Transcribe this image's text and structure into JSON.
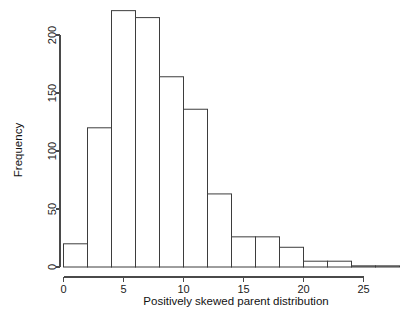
{
  "chart_data": {
    "type": "bar",
    "title": "",
    "subtitle": "",
    "xlabel": "Positively skewed parent distribution",
    "ylabel": "Frequency",
    "bin_width": 2,
    "bin_edges": [
      0,
      2,
      4,
      6,
      8,
      10,
      12,
      14,
      16,
      18,
      20,
      22,
      24,
      26,
      28
    ],
    "categories": [
      "0-2",
      "2-4",
      "4-6",
      "6-8",
      "8-10",
      "10-12",
      "12-14",
      "14-16",
      "16-18",
      "18-20",
      "20-22",
      "22-24",
      "24-26",
      "26-28"
    ],
    "values": [
      20,
      120,
      221,
      215,
      164,
      136,
      63,
      26,
      26,
      17,
      5,
      5,
      1,
      1
    ],
    "x": [
      1,
      3,
      5,
      7,
      9,
      11,
      13,
      15,
      17,
      19,
      21,
      23,
      25,
      27
    ],
    "xlim": [
      0,
      28
    ],
    "ylim": [
      0,
      225
    ],
    "xticks": [
      0,
      5,
      10,
      15,
      20,
      25
    ],
    "xtick_labels": [
      "0",
      "5",
      "10",
      "15",
      "20",
      "25"
    ],
    "yticks": [
      0,
      50,
      100,
      150,
      200
    ],
    "ytick_labels": [
      "0",
      "50",
      "100",
      "150",
      "200"
    ],
    "grid": false,
    "legend": false,
    "legend_position": "none",
    "bar_fill_color": "#ffffff",
    "bar_edge_color": "#3d3d3d",
    "axis_color": "#4a4a4a",
    "background_color": "#ffffff"
  },
  "figure": {
    "name": "histogram-positively-skewed-parent-distribution"
  }
}
